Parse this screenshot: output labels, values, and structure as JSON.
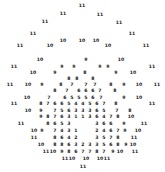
{
  "figure": {
    "type": "text-scatter",
    "width": 165,
    "height": 172,
    "background_color": "#ffffff",
    "label_color": "#1a1a1a"
  },
  "chart_data": {
    "type": "scatter",
    "title": "",
    "subtitle": "",
    "xlabel": "",
    "ylabel": "",
    "xlim": [
      0,
      165
    ],
    "ylim": [
      0,
      172
    ],
    "grid": false,
    "legend": false,
    "axes_visible": false,
    "value_range": [
      3,
      11
    ],
    "marker_style": "numeric-text-label",
    "points": [
      {
        "x": 82,
        "y": 6,
        "label": "11"
      },
      {
        "x": 63,
        "y": 14,
        "label": "11"
      },
      {
        "x": 100,
        "y": 15,
        "label": "11"
      },
      {
        "x": 45,
        "y": 22,
        "label": "11"
      },
      {
        "x": 119,
        "y": 23,
        "label": "11"
      },
      {
        "x": 33,
        "y": 34,
        "label": "11"
      },
      {
        "x": 63,
        "y": 41,
        "label": "10"
      },
      {
        "x": 82,
        "y": 41,
        "label": "10"
      },
      {
        "x": 96,
        "y": 41,
        "label": "10"
      },
      {
        "x": 132,
        "y": 34,
        "label": "11"
      },
      {
        "x": 20,
        "y": 46,
        "label": "11"
      },
      {
        "x": 50,
        "y": 46,
        "label": "10"
      },
      {
        "x": 108,
        "y": 46,
        "label": "10"
      },
      {
        "x": 146,
        "y": 46,
        "label": "11"
      },
      {
        "x": 40,
        "y": 60,
        "label": "10"
      },
      {
        "x": 86,
        "y": 60,
        "label": "9"
      },
      {
        "x": 121,
        "y": 60,
        "label": "10"
      },
      {
        "x": 14,
        "y": 67,
        "label": "11"
      },
      {
        "x": 62,
        "y": 67,
        "label": "9"
      },
      {
        "x": 74,
        "y": 67,
        "label": "9"
      },
      {
        "x": 100,
        "y": 67,
        "label": "9"
      },
      {
        "x": 108,
        "y": 67,
        "label": "9"
      },
      {
        "x": 152,
        "y": 67,
        "label": "11"
      },
      {
        "x": 33,
        "y": 73,
        "label": "10"
      },
      {
        "x": 55,
        "y": 73,
        "label": "9"
      },
      {
        "x": 85,
        "y": 73,
        "label": "8"
      },
      {
        "x": 116,
        "y": 73,
        "label": "9"
      },
      {
        "x": 133,
        "y": 73,
        "label": "10"
      },
      {
        "x": 69,
        "y": 79,
        "label": "8"
      },
      {
        "x": 77,
        "y": 79,
        "label": "8"
      },
      {
        "x": 93,
        "y": 79,
        "label": "8"
      },
      {
        "x": 10,
        "y": 85,
        "label": "11"
      },
      {
        "x": 28,
        "y": 85,
        "label": "10"
      },
      {
        "x": 42,
        "y": 85,
        "label": "9"
      },
      {
        "x": 61,
        "y": 85,
        "label": "8"
      },
      {
        "x": 72,
        "y": 85,
        "label": "7"
      },
      {
        "x": 86,
        "y": 85,
        "label": "7"
      },
      {
        "x": 95,
        "y": 85,
        "label": "7"
      },
      {
        "x": 111,
        "y": 85,
        "label": "8"
      },
      {
        "x": 124,
        "y": 85,
        "label": "9"
      },
      {
        "x": 139,
        "y": 85,
        "label": "10"
      },
      {
        "x": 157,
        "y": 85,
        "label": "11"
      },
      {
        "x": 55,
        "y": 91,
        "label": "8"
      },
      {
        "x": 67,
        "y": 91,
        "label": "7"
      },
      {
        "x": 79,
        "y": 91,
        "label": "6"
      },
      {
        "x": 86,
        "y": 91,
        "label": "6"
      },
      {
        "x": 93,
        "y": 91,
        "label": "6"
      },
      {
        "x": 100,
        "y": 91,
        "label": "7"
      },
      {
        "x": 115,
        "y": 91,
        "label": "8"
      },
      {
        "x": 27,
        "y": 98,
        "label": "10"
      },
      {
        "x": 49,
        "y": 98,
        "label": "7"
      },
      {
        "x": 65,
        "y": 98,
        "label": "6"
      },
      {
        "x": 72,
        "y": 98,
        "label": "5"
      },
      {
        "x": 79,
        "y": 98,
        "label": "5"
      },
      {
        "x": 86,
        "y": 98,
        "label": "5"
      },
      {
        "x": 93,
        "y": 98,
        "label": "6"
      },
      {
        "x": 101,
        "y": 98,
        "label": "7"
      },
      {
        "x": 124,
        "y": 98,
        "label": "9"
      },
      {
        "x": 139,
        "y": 98,
        "label": "10"
      },
      {
        "x": 14,
        "y": 104,
        "label": "11"
      },
      {
        "x": 41,
        "y": 104,
        "label": "8"
      },
      {
        "x": 48,
        "y": 104,
        "label": "7"
      },
      {
        "x": 55,
        "y": 104,
        "label": "6"
      },
      {
        "x": 62,
        "y": 104,
        "label": "6"
      },
      {
        "x": 69,
        "y": 104,
        "label": "5"
      },
      {
        "x": 76,
        "y": 104,
        "label": "4"
      },
      {
        "x": 83,
        "y": 104,
        "label": "4"
      },
      {
        "x": 90,
        "y": 104,
        "label": "5"
      },
      {
        "x": 97,
        "y": 104,
        "label": "6"
      },
      {
        "x": 104,
        "y": 104,
        "label": "7"
      },
      {
        "x": 116,
        "y": 104,
        "label": "8"
      },
      {
        "x": 152,
        "y": 104,
        "label": "11"
      },
      {
        "x": 28,
        "y": 111,
        "label": "10"
      },
      {
        "x": 41,
        "y": 111,
        "label": "9"
      },
      {
        "x": 55,
        "y": 111,
        "label": "7"
      },
      {
        "x": 62,
        "y": 111,
        "label": "5"
      },
      {
        "x": 69,
        "y": 111,
        "label": "6"
      },
      {
        "x": 76,
        "y": 111,
        "label": "3"
      },
      {
        "x": 83,
        "y": 111,
        "label": "3"
      },
      {
        "x": 90,
        "y": 111,
        "label": "3"
      },
      {
        "x": 97,
        "y": 111,
        "label": "6"
      },
      {
        "x": 104,
        "y": 111,
        "label": "5"
      },
      {
        "x": 117,
        "y": 111,
        "label": "7"
      },
      {
        "x": 130,
        "y": 111,
        "label": "8"
      },
      {
        "x": 41,
        "y": 117,
        "label": "9"
      },
      {
        "x": 48,
        "y": 117,
        "label": "8"
      },
      {
        "x": 55,
        "y": 117,
        "label": "7"
      },
      {
        "x": 62,
        "y": 117,
        "label": "6"
      },
      {
        "x": 69,
        "y": 117,
        "label": "3"
      },
      {
        "x": 76,
        "y": 117,
        "label": "1"
      },
      {
        "x": 83,
        "y": 117,
        "label": "1"
      },
      {
        "x": 90,
        "y": 117,
        "label": "3"
      },
      {
        "x": 97,
        "y": 117,
        "label": "6"
      },
      {
        "x": 104,
        "y": 117,
        "label": "4"
      },
      {
        "x": 111,
        "y": 117,
        "label": "7"
      },
      {
        "x": 118,
        "y": 117,
        "label": "8"
      },
      {
        "x": 131,
        "y": 117,
        "label": "10"
      },
      {
        "x": 21,
        "y": 124,
        "label": "11"
      },
      {
        "x": 48,
        "y": 124,
        "label": "8"
      },
      {
        "x": 55,
        "y": 124,
        "label": "6"
      },
      {
        "x": 62,
        "y": 124,
        "label": "5"
      },
      {
        "x": 69,
        "y": 124,
        "label": "3"
      },
      {
        "x": 97,
        "y": 124,
        "label": "3"
      },
      {
        "x": 104,
        "y": 124,
        "label": "6"
      },
      {
        "x": 111,
        "y": 124,
        "label": "6"
      },
      {
        "x": 124,
        "y": 124,
        "label": "9"
      },
      {
        "x": 144,
        "y": 124,
        "label": "11"
      },
      {
        "x": 34,
        "y": 131,
        "label": "10"
      },
      {
        "x": 42,
        "y": 131,
        "label": "9"
      },
      {
        "x": 55,
        "y": 131,
        "label": "7"
      },
      {
        "x": 62,
        "y": 131,
        "label": "4"
      },
      {
        "x": 69,
        "y": 131,
        "label": "3"
      },
      {
        "x": 76,
        "y": 131,
        "label": "1"
      },
      {
        "x": 97,
        "y": 131,
        "label": "2"
      },
      {
        "x": 104,
        "y": 131,
        "label": "4"
      },
      {
        "x": 111,
        "y": 131,
        "label": "6"
      },
      {
        "x": 118,
        "y": 131,
        "label": "7"
      },
      {
        "x": 125,
        "y": 131,
        "label": "9"
      },
      {
        "x": 138,
        "y": 131,
        "label": "10"
      },
      {
        "x": 34,
        "y": 138,
        "label": "11"
      },
      {
        "x": 55,
        "y": 138,
        "label": "8"
      },
      {
        "x": 62,
        "y": 138,
        "label": "6"
      },
      {
        "x": 69,
        "y": 138,
        "label": "4"
      },
      {
        "x": 76,
        "y": 138,
        "label": "2"
      },
      {
        "x": 97,
        "y": 138,
        "label": "3"
      },
      {
        "x": 104,
        "y": 138,
        "label": "5"
      },
      {
        "x": 111,
        "y": 138,
        "label": "7"
      },
      {
        "x": 118,
        "y": 138,
        "label": "8"
      },
      {
        "x": 134,
        "y": 138,
        "label": "11"
      },
      {
        "x": 41,
        "y": 145,
        "label": "10"
      },
      {
        "x": 55,
        "y": 145,
        "label": "8"
      },
      {
        "x": 62,
        "y": 145,
        "label": "8"
      },
      {
        "x": 69,
        "y": 145,
        "label": "6"
      },
      {
        "x": 76,
        "y": 145,
        "label": "3"
      },
      {
        "x": 83,
        "y": 145,
        "label": "2"
      },
      {
        "x": 90,
        "y": 145,
        "label": "3"
      },
      {
        "x": 97,
        "y": 145,
        "label": "3"
      },
      {
        "x": 104,
        "y": 145,
        "label": "5"
      },
      {
        "x": 111,
        "y": 145,
        "label": "6"
      },
      {
        "x": 118,
        "y": 145,
        "label": "8"
      },
      {
        "x": 126,
        "y": 145,
        "label": "9"
      },
      {
        "x": 133,
        "y": 145,
        "label": "10"
      },
      {
        "x": 46,
        "y": 152,
        "label": "11"
      },
      {
        "x": 53,
        "y": 152,
        "label": "10"
      },
      {
        "x": 62,
        "y": 152,
        "label": "9"
      },
      {
        "x": 69,
        "y": 152,
        "label": "8"
      },
      {
        "x": 76,
        "y": 152,
        "label": "6"
      },
      {
        "x": 83,
        "y": 152,
        "label": "7"
      },
      {
        "x": 90,
        "y": 152,
        "label": "7"
      },
      {
        "x": 97,
        "y": 152,
        "label": "8"
      },
      {
        "x": 104,
        "y": 152,
        "label": "7"
      },
      {
        "x": 113,
        "y": 152,
        "label": "9"
      },
      {
        "x": 120,
        "y": 152,
        "label": "10"
      },
      {
        "x": 135,
        "y": 152,
        "label": "11"
      },
      {
        "x": 65,
        "y": 159,
        "label": "11"
      },
      {
        "x": 72,
        "y": 159,
        "label": "10"
      },
      {
        "x": 86,
        "y": 159,
        "label": "10"
      },
      {
        "x": 100,
        "y": 159,
        "label": "10"
      },
      {
        "x": 107,
        "y": 159,
        "label": "11"
      },
      {
        "x": 83,
        "y": 167,
        "label": "11"
      }
    ]
  }
}
